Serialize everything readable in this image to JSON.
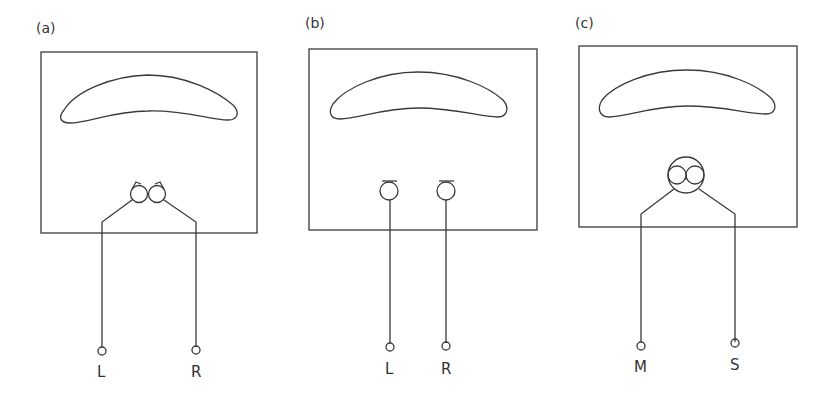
{
  "figure": {
    "panels": [
      {
        "id": "a",
        "label": "(a)",
        "configuration": "coincident pair, crossed figure-of-eight/cardioid capsules angled apart",
        "outputs": [
          "L",
          "R"
        ]
      },
      {
        "id": "b",
        "label": "(b)",
        "configuration": "spaced pair of omnidirectional microphones",
        "outputs": [
          "L",
          "R"
        ]
      },
      {
        "id": "c",
        "label": "(c)",
        "configuration": "mid-side (M/S) pair in single housing",
        "outputs": [
          "M",
          "S"
        ]
      }
    ],
    "colors": {
      "line": "#3a3a3a",
      "text": "#333333",
      "background": "#ffffff"
    }
  }
}
